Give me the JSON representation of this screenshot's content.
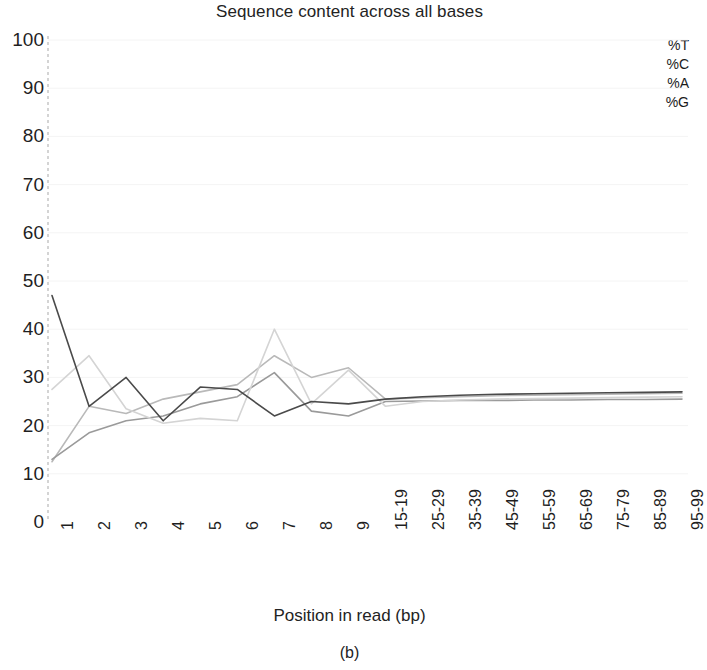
{
  "chart_data": {
    "type": "line",
    "title": "Sequence content across all bases",
    "xlabel": "Position in read (bp)",
    "ylabel": "",
    "ylim": [
      0,
      100
    ],
    "yticks": [
      "0",
      "10",
      "20",
      "30",
      "40",
      "50",
      "60",
      "70",
      "80",
      "90",
      "100"
    ],
    "grid": false,
    "legend_position": "top-right",
    "categories": [
      "1",
      "2",
      "3",
      "4",
      "5",
      "6",
      "7",
      "8",
      "9",
      "15-19",
      "25-29",
      "35-39",
      "45-49",
      "55-59",
      "65-69",
      "75-79",
      "85-89",
      "95-99"
    ],
    "x_tick_labels": [
      "1",
      "2",
      "3",
      "4",
      "5",
      "6",
      "7",
      "8",
      "9",
      "15-19",
      "25-29",
      "35-39",
      "45-49",
      "55-59",
      "65-69",
      "75-79",
      "85-89",
      "95-99"
    ],
    "series": [
      {
        "name": "%T",
        "color": "#b9b9b9",
        "values": [
          12.5,
          24.0,
          22.5,
          25.5,
          27.0,
          28.5,
          34.5,
          30.0,
          32.0,
          25.5,
          25.8,
          26.0,
          26.2,
          26.3,
          26.4,
          26.5,
          26.6,
          26.7
        ]
      },
      {
        "name": "%C",
        "color": "#9a9a9a",
        "values": [
          13.0,
          18.5,
          21.0,
          22.0,
          24.5,
          26.0,
          31.0,
          23.0,
          22.0,
          25.0,
          25.1,
          25.2,
          25.2,
          25.3,
          25.3,
          25.4,
          25.4,
          25.5
        ]
      },
      {
        "name": "%A",
        "color": "#d4d4d4",
        "values": [
          27.5,
          34.5,
          23.5,
          20.5,
          21.5,
          21.0,
          40.0,
          24.5,
          31.5,
          24.0,
          25.0,
          25.3,
          25.5,
          25.6,
          25.7,
          25.8,
          25.9,
          26.0
        ]
      },
      {
        "name": "%G",
        "color": "#4a4a4a",
        "values": [
          47.0,
          24.0,
          30.0,
          21.0,
          28.0,
          27.5,
          22.0,
          25.0,
          24.5,
          25.5,
          26.0,
          26.3,
          26.5,
          26.6,
          26.7,
          26.8,
          26.9,
          27.0
        ]
      }
    ],
    "caption": "(b)"
  },
  "legend": {
    "entries": [
      {
        "label": "%T"
      },
      {
        "label": "%C"
      },
      {
        "label": "%A"
      },
      {
        "label": "%G"
      }
    ]
  }
}
